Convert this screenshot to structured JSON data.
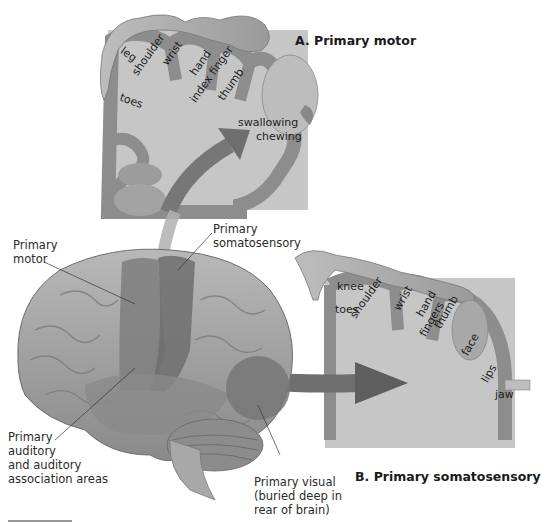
{
  "figure": {
    "panel_a": {
      "title": "A. Primary motor",
      "body_labels": [
        "leg",
        "shoulder",
        "wrist",
        "hand",
        "index finger",
        "thumb",
        "toes",
        "swallowing",
        "chewing"
      ]
    },
    "panel_b": {
      "title": "B. Primary somatosensory",
      "body_labels": [
        "knee",
        "shoulder",
        "wrist",
        "hand",
        "fingers",
        "thumb",
        "toes",
        "face",
        "lips",
        "jaw"
      ]
    },
    "brain_labels": {
      "primary_motor": [
        "Primary",
        "motor"
      ],
      "primary_somatosensory": [
        "Primary",
        "somatosensory"
      ],
      "primary_auditory": [
        "Primary",
        "auditory",
        "and auditory",
        "association areas"
      ],
      "primary_visual": [
        "Primary visual",
        "(buried deep in",
        "rear of brain)"
      ]
    },
    "colors": {
      "background": "#ffffff",
      "cortex_band": "#8c8c8c",
      "cortex_inner": "#c4c4c4",
      "brain_surface": "#9a9a9a",
      "arrow": "#6e6e6e",
      "text": "#222222"
    }
  }
}
